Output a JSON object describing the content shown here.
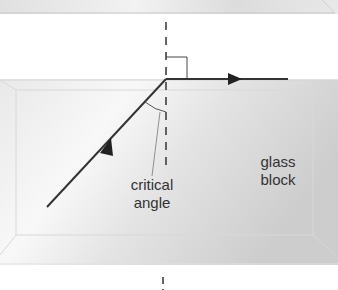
{
  "diagram": {
    "labels": {
      "critical_angle": "critical angle",
      "glass_block": "glass block"
    },
    "elements": {
      "upper_block": "glass block (top edge visible)",
      "main_block": "glass block",
      "normal_line": "dashed normal line",
      "incident_ray": "incident ray with arrow",
      "refracted_ray": "ray along surface with arrow",
      "right_angle_marker": "right angle square",
      "angle_arc": "critical angle arc"
    },
    "colors": {
      "ray": "#333333",
      "glass_light": "#f4f4f4",
      "glass_dark": "#cfcfcf",
      "edge": "#d8d8d8",
      "text": "#333333"
    }
  }
}
